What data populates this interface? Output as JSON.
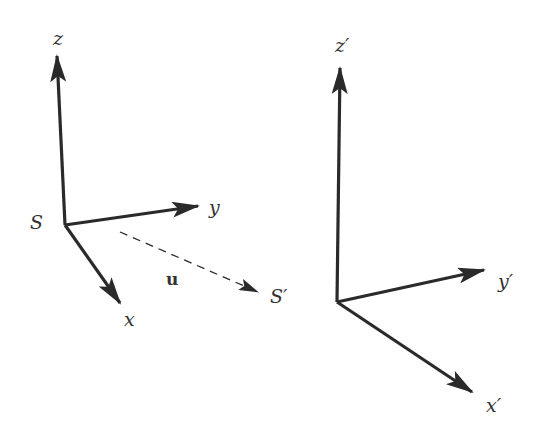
{
  "diagram": {
    "frame_s": {
      "name": "S",
      "axes": {
        "x": "x",
        "y": "y",
        "z": "z"
      }
    },
    "frame_s_prime": {
      "name": "S′",
      "axes": {
        "x": "x′",
        "y": "y′",
        "z": "z′"
      }
    },
    "velocity": {
      "label": "u",
      "style": "dashed arrow from S toward S′"
    },
    "colors": {
      "line": "#2a2a2a",
      "text": "#333333",
      "background": "#ffffff"
    }
  }
}
